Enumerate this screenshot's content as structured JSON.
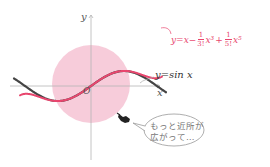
{
  "figure": {
    "axes": {
      "x_label": "x",
      "y_label": "y",
      "origin_label": "O",
      "axis_color": "#b5b5b5"
    },
    "curves": [
      {
        "name": "taylor-polynomial",
        "equation": "y = x − (1/3!)x³ + (1/5!)x⁵",
        "label_parts": {
          "lhs": "y=x−",
          "frac1_num": "1",
          "frac1_den": "3!",
          "term1": "x³",
          "plus": "+",
          "frac2_num": "1",
          "frac2_den": "5!",
          "term2": "x⁵"
        },
        "color": "#e8466e"
      },
      {
        "name": "sine",
        "equation": "y = sin x",
        "label": "y=sin x",
        "color": "#444444"
      }
    ],
    "approx_region": {
      "shape": "circle",
      "color": "#f6c3d3"
    },
    "callout": {
      "text_line1": "もっと近所が",
      "text_line2": "広がって…",
      "icon": "pointing-hand-icon"
    }
  }
}
